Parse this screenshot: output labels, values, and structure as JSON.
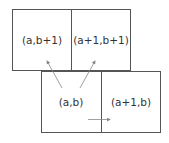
{
  "diagram": {
    "cells": [
      {
        "id": "top-left",
        "label": "(a,b+1)"
      },
      {
        "id": "top-right",
        "label": "(a+1,b+1)"
      },
      {
        "id": "bottom-left",
        "label": "(a,b)"
      },
      {
        "id": "bottom-right",
        "label": "(a+1,b)"
      }
    ],
    "arrows": [
      {
        "from": "(a,b)",
        "to": "(a,b+1)"
      },
      {
        "from": "(a,b)",
        "to": "(a+1,b+1)"
      },
      {
        "from": "(a,b)",
        "to": "(a+1,b)"
      }
    ],
    "colors": {
      "line": "#555555",
      "arrow": "#888888",
      "text": "#333333"
    }
  }
}
